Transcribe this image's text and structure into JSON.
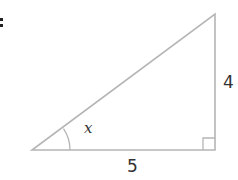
{
  "diagram": {
    "type": "right-triangle",
    "vertices": {
      "bottom_left": [
        32,
        150
      ],
      "bottom_right": [
        215,
        150
      ],
      "top_right": [
        215,
        14
      ]
    },
    "stroke_color": "#b5b5b5",
    "labels": {
      "angle": "x",
      "vertical_side": "4",
      "horizontal_side": "5"
    },
    "right_angle_marker": "bottom_right",
    "angle_arc_at": "bottom_left"
  }
}
